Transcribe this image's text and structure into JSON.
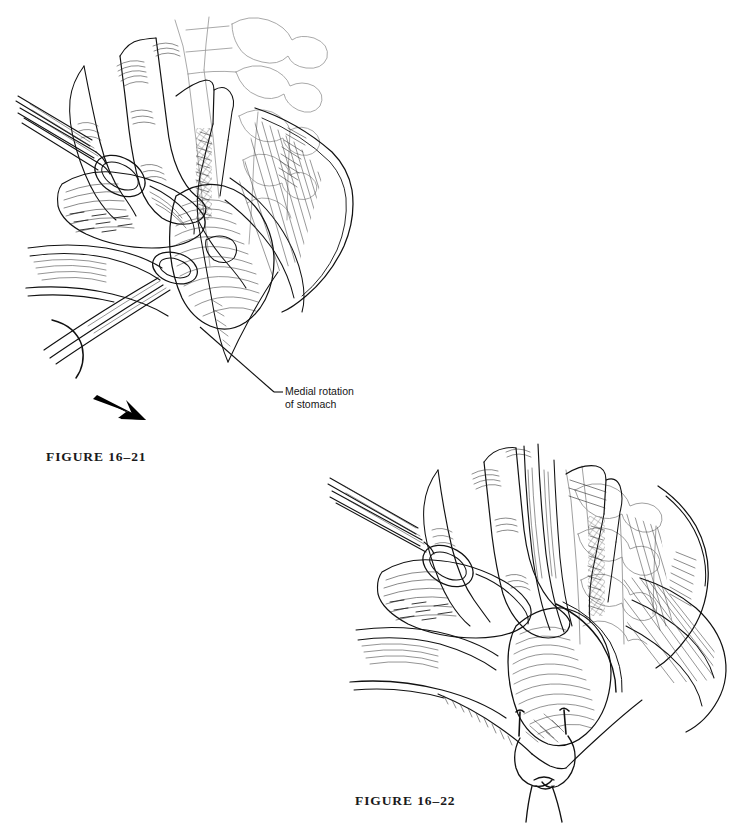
{
  "page": {
    "background_color": "#ffffff",
    "ink_color": "#111111",
    "width": 742,
    "height": 833
  },
  "figures": [
    {
      "id": "figure-16-21",
      "caption": "FIGURE 16–21",
      "subject": "Medial rotation of the stomach exposing the posterior gastric attachments",
      "labels": [
        {
          "id": "medial-rotation-of-stomach",
          "line1": "Medial rotation",
          "line2": "of stomach",
          "leader": {
            "x1": 200,
            "y1": 327,
            "x2": 281,
            "y2": 391
          }
        }
      ],
      "arrow": {
        "id": "direction-arrow",
        "color": "#000000",
        "description": "solid black arrow indicating direction of traction"
      },
      "elements": [
        "surgeon-fingers",
        "ring-handled-clamp",
        "gauze-sponge",
        "retracted-stomach",
        "vertebral-column",
        "diaphragmatic-crus",
        "incised-peritoneum",
        "hatched-muscle-wall"
      ]
    },
    {
      "id": "figure-16-22",
      "caption": "FIGURE 16–22",
      "subject": "Esophagus encircled and elevated with sutures placed at the hiatus",
      "labels": [],
      "elements": [
        "surgeon-fingers",
        "ring-handled-clamp",
        "gauze-sponge",
        "elevated-esophagus",
        "vagus-nerve",
        "vertebral-column",
        "diaphragmatic-crus",
        "hiatal-sutures",
        "hatched-muscle-wall"
      ]
    }
  ]
}
